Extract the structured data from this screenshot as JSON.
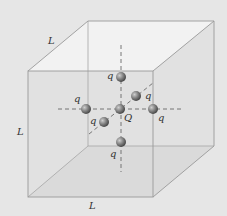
{
  "figure": {
    "edge_labels": [
      "L",
      "L",
      "L"
    ],
    "center_charge": "Q",
    "charges": [
      "q",
      "q",
      "q",
      "q",
      "q",
      "q"
    ],
    "colors": {
      "background": "#e6e6e6",
      "edge": "#9a9a9a",
      "face_top": "#f4f4f4",
      "sphere": "#7d7d7d",
      "axis": "#6a6a6a"
    }
  }
}
